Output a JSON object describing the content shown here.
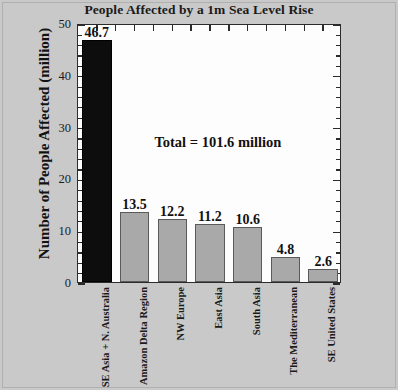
{
  "chart_data": {
    "type": "bar",
    "title": "People Affected by a 1m Sea Level Rise",
    "xlabel": "",
    "ylabel": "Number of People Affected (million)",
    "ylim": [
      0,
      50
    ],
    "yticks": [
      0,
      10,
      20,
      30,
      40,
      50
    ],
    "ytick_labels": [
      "0",
      "10",
      "20",
      "30",
      "40",
      "50"
    ],
    "y_minor_tick_step": 2,
    "grid": false,
    "legend": null,
    "categories": [
      "SE Asia + N. Australia",
      "Amazon Delta Region",
      "NW Europe",
      "East Asia",
      "South Asia",
      "The Mediterranean",
      "SE United States"
    ],
    "values": [
      46.7,
      13.5,
      12.2,
      11.2,
      10.6,
      4.8,
      2.6
    ],
    "value_labels": [
      "46.7",
      "13.5",
      "12.2",
      "11.2",
      "10.6",
      "4.8",
      "2.6"
    ],
    "bar_colors": [
      "#0d0d0d",
      "#a9a9a9",
      "#a9a9a9",
      "#a9a9a9",
      "#a9a9a9",
      "#a9a9a9",
      "#a9a9a9"
    ],
    "annotations": [
      {
        "text": "Total = 101.6 million",
        "x_frac": 0.53,
        "y_value": 27.5
      }
    ]
  },
  "style": {
    "canvas_background": "#c9c9c9",
    "plot_background": "#fdfdfd",
    "axis_color": "#2b2b2b",
    "text_color": "#111111",
    "highlight_bar_color": "#0d0d0d",
    "standard_bar_color": "#a9a9a9"
  }
}
